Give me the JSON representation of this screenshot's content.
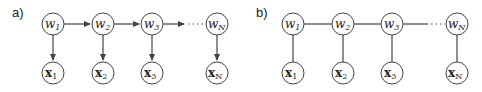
{
  "panels": [
    {
      "label": "a)",
      "type": "directed",
      "w_nodes": [
        {
          "name": "w",
          "sub": "1"
        },
        {
          "name": "w",
          "sub": "2"
        },
        {
          "name": "w",
          "sub": "3"
        },
        {
          "name": "w",
          "sub": "N"
        }
      ],
      "x_nodes": [
        {
          "name": "x",
          "sub": "1"
        },
        {
          "name": "x",
          "sub": "2"
        },
        {
          "name": "x",
          "sub": "3"
        },
        {
          "name": "x",
          "sub": "N"
        }
      ]
    },
    {
      "label": "b)",
      "type": "undirected",
      "w_nodes": [
        {
          "name": "w",
          "sub": "1"
        },
        {
          "name": "w",
          "sub": "2"
        },
        {
          "name": "w",
          "sub": "3"
        },
        {
          "name": "w",
          "sub": "N"
        }
      ],
      "x_nodes": [
        {
          "name": "x",
          "sub": "1"
        },
        {
          "name": "x",
          "sub": "2"
        },
        {
          "name": "x",
          "sub": "3"
        },
        {
          "name": "x",
          "sub": "N"
        }
      ]
    }
  ],
  "colors": {
    "stroke": "#444444",
    "text": "#222222",
    "background": "#ffffff"
  }
}
